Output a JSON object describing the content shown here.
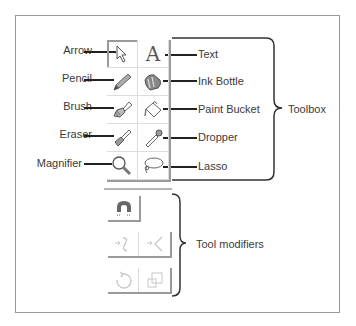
{
  "diagram": {
    "left_labels": [
      "Arrow",
      "Pencil",
      "Brush",
      "Eraser",
      "Magnifier"
    ],
    "right_labels": [
      "Text",
      "Ink Bottle",
      "Paint Bucket",
      "Dropper",
      "Lasso"
    ],
    "toolbox_label": "Toolbox",
    "modifiers_label": "Tool modifiers",
    "tools": [
      {
        "name": "Arrow",
        "icon": "arrow-icon",
        "column": "left",
        "row": 1
      },
      {
        "name": "Text",
        "icon": "text-icon",
        "column": "right",
        "row": 1
      },
      {
        "name": "Pencil",
        "icon": "pencil-icon",
        "column": "left",
        "row": 2
      },
      {
        "name": "Ink Bottle",
        "icon": "ink-bottle-icon",
        "column": "right",
        "row": 2
      },
      {
        "name": "Brush",
        "icon": "brush-icon",
        "column": "left",
        "row": 3
      },
      {
        "name": "Paint Bucket",
        "icon": "paint-bucket-icon",
        "column": "right",
        "row": 3
      },
      {
        "name": "Eraser",
        "icon": "eraser-icon",
        "column": "left",
        "row": 4
      },
      {
        "name": "Dropper",
        "icon": "dropper-icon",
        "column": "right",
        "row": 4
      },
      {
        "name": "Magnifier",
        "icon": "magnifier-icon",
        "column": "left",
        "row": 5
      },
      {
        "name": "Lasso",
        "icon": "lasso-icon",
        "column": "right",
        "row": 5
      }
    ],
    "modifiers": [
      {
        "icon": "snap-magnet-icon",
        "enabled": true
      },
      {
        "icon": "smooth-icon",
        "enabled": false
      },
      {
        "icon": "straighten-icon",
        "enabled": false
      },
      {
        "icon": "rotate-icon",
        "enabled": false
      },
      {
        "icon": "scale-icon",
        "enabled": false
      }
    ],
    "colors": {
      "frame": "#9a9a9a",
      "leader": "#222222",
      "text": "#3a3a3a",
      "disabled_icon": "#c8c8c8"
    }
  }
}
